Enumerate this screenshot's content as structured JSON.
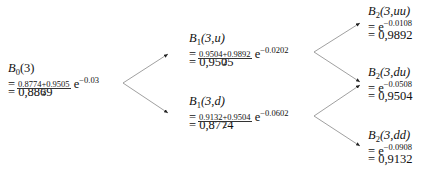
{
  "tree": {
    "root": {
      "label_main": "B",
      "label_sub": "0",
      "label_args": "(3)",
      "frac_num": "0.8774+0.9505",
      "frac_den": "2",
      "exp_base": "e",
      "exp": "−0.03",
      "result": "= 0,8869"
    },
    "level1": [
      {
        "label_main": "B",
        "label_sub": "1",
        "label_args": "(3,u)",
        "frac_num": "0.9504+0.9892",
        "frac_den": "2",
        "exp_base": "e",
        "exp": "−0.0202",
        "result": "= 0,9505"
      },
      {
        "label_main": "B",
        "label_sub": "1",
        "label_args": "(3,d)",
        "frac_num": "0.9132+0.9504",
        "frac_den": "2",
        "exp_base": "e",
        "exp": "−0.0602",
        "result": "= 0,8774"
      }
    ],
    "level2": [
      {
        "label_main": "B",
        "label_sub": "2",
        "label_args": "(3,uu)",
        "exp_base": "= e",
        "exp": "−0.0108",
        "result": "= 0,9892"
      },
      {
        "label_main": "B",
        "label_sub": "2",
        "label_args": "(3,du)",
        "exp_base": "= e",
        "exp": "−0.0508",
        "result": "= 0,9504"
      },
      {
        "label_main": "B",
        "label_sub": "2",
        "label_args": "(3,dd)",
        "exp_base": "= e",
        "exp": "−0.0908",
        "result": "= 0,9132"
      }
    ],
    "eq": "="
  }
}
